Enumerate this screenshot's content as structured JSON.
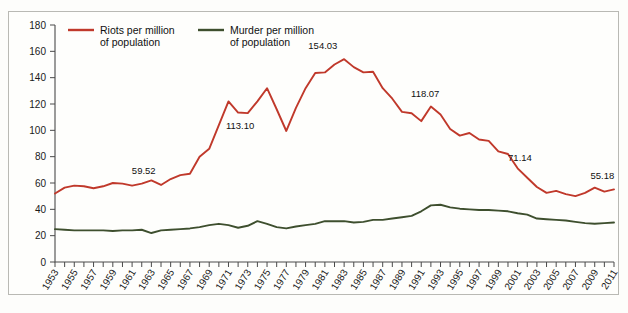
{
  "figure": {
    "background_color": "#fefefc",
    "frame_color": "#b9b9b4"
  },
  "legend": {
    "position": "top-left-inside",
    "entries": [
      {
        "label_line1": "Riots per million",
        "label_line2": "of population",
        "color": "#c0392b",
        "name": "riots"
      },
      {
        "label_line1": "Murder per million",
        "label_line2": "of population",
        "color": "#3e4f2e",
        "name": "murder"
      }
    ]
  },
  "axes": {
    "y_ticks": [
      "0",
      "20",
      "40",
      "60",
      "80",
      "100",
      "120",
      "140",
      "160",
      "180"
    ],
    "x_ticks": [
      "1953",
      "1955",
      "1957",
      "1959",
      "1961",
      "1963",
      "1965",
      "1967",
      "1969",
      "1971",
      "1973",
      "1975",
      "1977",
      "1979",
      "1981",
      "1983",
      "1985",
      "1987",
      "1989",
      "1991",
      "1993",
      "1995",
      "1997",
      "1999",
      "2001",
      "2003",
      "2005",
      "2007",
      "2009",
      "2011"
    ]
  },
  "annotations": [
    {
      "text": "59.52",
      "year": 1962,
      "value": 59.52
    },
    {
      "text": "113.10",
      "year": 1972,
      "value": 113.1
    },
    {
      "text": "154.03",
      "year": 1981,
      "value": 154.03
    },
    {
      "text": "118.07",
      "year": 1991,
      "value": 118.07
    },
    {
      "text": "71.14",
      "year": 2000,
      "value": 71.14
    },
    {
      "text": "55.18",
      "year": 2010,
      "value": 55.18
    }
  ],
  "chart_data": {
    "type": "line",
    "title": "",
    "xlabel": "",
    "ylabel": "",
    "xlim": [
      1953,
      2011
    ],
    "ylim": [
      0,
      180
    ],
    "grid": false,
    "legend_position": "top-left",
    "x": [
      1953,
      1954,
      1955,
      1956,
      1957,
      1958,
      1959,
      1960,
      1961,
      1962,
      1963,
      1964,
      1965,
      1966,
      1967,
      1968,
      1969,
      1970,
      1971,
      1972,
      1973,
      1974,
      1975,
      1976,
      1977,
      1978,
      1979,
      1980,
      1981,
      1982,
      1983,
      1984,
      1985,
      1986,
      1987,
      1988,
      1989,
      1990,
      1991,
      1992,
      1993,
      1994,
      1995,
      1996,
      1997,
      1998,
      1999,
      2000,
      2001,
      2002,
      2003,
      2004,
      2005,
      2006,
      2007,
      2008,
      2009,
      2010,
      2011
    ],
    "series": [
      {
        "name": "Riots per million of population",
        "color": "#c0392b",
        "values": [
          52.0,
          56.5,
          58.0,
          57.5,
          56.0,
          57.5,
          60.0,
          59.5,
          58.0,
          59.52,
          62.0,
          58.5,
          63.0,
          66.0,
          67.0,
          80.0,
          86.0,
          104.0,
          122.0,
          113.5,
          113.1,
          122.0,
          132.0,
          116.0,
          99.5,
          117.0,
          132.0,
          143.5,
          144.0,
          150.0,
          154.03,
          148.0,
          144.0,
          144.5,
          132.0,
          124.0,
          114.0,
          113.0,
          107.0,
          118.07,
          112.0,
          101.0,
          96.0,
          98.0,
          93.0,
          92.0,
          84.0,
          82.0,
          71.14,
          64.0,
          57.0,
          52.5,
          54.0,
          51.5,
          50.0,
          52.5,
          56.5,
          53.5,
          55.18
        ]
      },
      {
        "name": "Murder per million of population",
        "color": "#3e4f2e",
        "values": [
          25.0,
          24.5,
          24.0,
          24.0,
          24.0,
          24.0,
          23.5,
          24.0,
          24.0,
          24.5,
          22.0,
          24.0,
          24.5,
          25.0,
          25.5,
          26.5,
          28.0,
          29.0,
          28.0,
          26.0,
          27.5,
          31.0,
          29.0,
          26.5,
          25.5,
          27.0,
          28.0,
          29.0,
          31.0,
          31.0,
          31.0,
          30.0,
          30.5,
          32.0,
          32.0,
          33.0,
          34.0,
          35.0,
          38.5,
          43.0,
          43.5,
          41.5,
          40.5,
          40.0,
          39.5,
          39.5,
          39.0,
          38.5,
          37.0,
          36.0,
          33.0,
          32.5,
          32.0,
          31.5,
          30.5,
          29.5,
          29.0,
          29.5,
          30.0
        ]
      }
    ]
  }
}
